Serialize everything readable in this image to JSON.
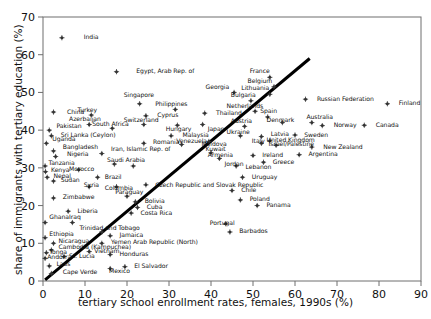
{
  "chart_data": {
    "type": "scatter",
    "title": "",
    "xlabel": "tertiary school enrollment rates, females, 1990s (%)",
    "ylabel": "share of immigrants with tertiary education (%)",
    "xlim": [
      0,
      90
    ],
    "ylim": [
      0,
      70
    ],
    "xticks": [
      0,
      10,
      20,
      30,
      40,
      50,
      60,
      70,
      80,
      90
    ],
    "yticks": [
      0,
      10,
      20,
      30,
      40,
      50,
      60,
      70
    ],
    "grid": false,
    "legend": "none",
    "marker_color": "#333333",
    "trendline_color": "#000000",
    "trendline": {
      "x0": 0.5,
      "y0": 0.3,
      "x1": 63.5,
      "y1": 59.0,
      "label": "fit-line"
    },
    "points": [
      {
        "label": "India",
        "x": 4.5,
        "y": 64.5,
        "lx": 9.0,
        "ly": 64.5
      },
      {
        "label": "Egypt, Arab Rep. of",
        "x": 17.5,
        "y": 55.5,
        "lx": 21.5,
        "ly": 55.5
      },
      {
        "label": "Singapore",
        "x": 23.0,
        "y": 47.0,
        "lx": 18.5,
        "ly": 49.2
      },
      {
        "label": "Georgia",
        "x": 45.5,
        "y": 50.0,
        "lx": 38.0,
        "ly": 51.2
      },
      {
        "label": "Bulgaria",
        "x": 49.5,
        "y": 47.8,
        "lx": 44.0,
        "ly": 49.2
      },
      {
        "label": "Lithuania",
        "x": 54.0,
        "y": 49.5,
        "lx": 46.5,
        "ly": 51.0
      },
      {
        "label": "Belgium",
        "x": 55.0,
        "y": 51.5,
        "lx": 48.0,
        "ly": 53.0
      },
      {
        "label": "France",
        "x": 54.0,
        "y": 54.0,
        "lx": 48.5,
        "ly": 55.5
      },
      {
        "label": "Russian Federation",
        "x": 62.5,
        "y": 48.2,
        "lx": 64.5,
        "ly": 48.2
      },
      {
        "label": "Finland",
        "x": 82.0,
        "y": 47.0,
        "lx": 84.0,
        "ly": 47.0
      },
      {
        "label": "China",
        "x": 2.5,
        "y": 44.8,
        "lx": 5.0,
        "ly": 44.8
      },
      {
        "label": "Turkey",
        "x": 11.5,
        "y": 44.0,
        "lx": 7.5,
        "ly": 45.2
      },
      {
        "label": "Cyprus",
        "x": 24.5,
        "y": 43.8,
        "lx": 26.5,
        "ly": 43.8
      },
      {
        "label": "Philippines",
        "x": 31.5,
        "y": 45.5,
        "lx": 26.0,
        "ly": 46.8
      },
      {
        "label": "Thailand",
        "x": 38.5,
        "y": 44.5,
        "lx": 40.5,
        "ly": 44.5
      },
      {
        "label": "Netherlands",
        "x": 50.5,
        "y": 45.0,
        "lx": 43.0,
        "ly": 46.2
      },
      {
        "label": "Spain",
        "x": 53.5,
        "y": 43.5,
        "lx": 51.0,
        "ly": 45.0
      },
      {
        "label": "Azerbaijan",
        "x": 11.0,
        "y": 41.5,
        "lx": 5.5,
        "ly": 42.8
      },
      {
        "label": "Switzerland",
        "x": 24.0,
        "y": 41.5,
        "lx": 18.5,
        "ly": 42.6
      },
      {
        "label": "South Africa",
        "x": 16.5,
        "y": 40.5,
        "lx": 11.0,
        "ly": 41.5
      },
      {
        "label": "Pakistan",
        "x": 1.5,
        "y": 40.0,
        "lx": 2.5,
        "ly": 41.0
      },
      {
        "label": "Hungary",
        "x": 32.0,
        "y": 41.3,
        "lx": 28.5,
        "ly": 40.2
      },
      {
        "label": "Japan",
        "x": 38.0,
        "y": 41.5,
        "lx": 38.5,
        "ly": 40.2
      },
      {
        "label": "Austria",
        "x": 48.0,
        "y": 41.0,
        "lx": 44.0,
        "ly": 42.2
      },
      {
        "label": "Denmark",
        "x": 57.0,
        "y": 42.0,
        "lx": 52.5,
        "ly": 42.5
      },
      {
        "label": "Australia",
        "x": 64.0,
        "y": 42.0,
        "lx": 62.0,
        "ly": 43.4
      },
      {
        "label": "Norway",
        "x": 66.5,
        "y": 41.2,
        "lx": 68.5,
        "ly": 41.2
      },
      {
        "label": "Canada",
        "x": 76.5,
        "y": 41.3,
        "lx": 78.5,
        "ly": 41.3
      },
      {
        "label": "Sri Lanka (Ceylon)",
        "x": 2.0,
        "y": 38.5,
        "lx": 3.5,
        "ly": 38.5
      },
      {
        "label": "Malaysia",
        "x": 30.5,
        "y": 38.5,
        "lx": 32.5,
        "ly": 38.5
      },
      {
        "label": "Moldova",
        "x": 39.5,
        "y": 37.0,
        "lx": 37.0,
        "ly": 36.2
      },
      {
        "label": "Ukraine",
        "x": 47.0,
        "y": 38.5,
        "lx": 43.0,
        "ly": 39.5
      },
      {
        "label": "Latvia",
        "x": 52.0,
        "y": 38.3,
        "lx": 53.5,
        "ly": 38.8
      },
      {
        "label": "Sweden",
        "x": 60.0,
        "y": 38.7,
        "lx": 61.5,
        "ly": 38.7
      },
      {
        "label": "Uganda",
        "x": 0.8,
        "y": 36.5,
        "lx": 1.5,
        "ly": 37.5
      },
      {
        "label": "Romania",
        "x": 24.0,
        "y": 36.5,
        "lx": 25.5,
        "ly": 36.8
      },
      {
        "label": "Venezuela",
        "x": 33.0,
        "y": 36.2,
        "lx": 31.0,
        "ly": 37.0
      },
      {
        "label": "Italy",
        "x": 52.0,
        "y": 36.5,
        "lx": 49.0,
        "ly": 37.0
      },
      {
        "label": "Israel/Palestine",
        "x": 55.5,
        "y": 36.0,
        "lx": 53.0,
        "ly": 36.2
      },
      {
        "label": "United Kingdom",
        "x": 54.0,
        "y": 37.2,
        "lx": 52.5,
        "ly": 37.2
      },
      {
        "label": "Bangladesh",
        "x": 2.5,
        "y": 34.5,
        "lx": 4.0,
        "ly": 35.3
      },
      {
        "label": "Nigeria",
        "x": 3.0,
        "y": 33.0,
        "lx": 5.0,
        "ly": 33.5
      },
      {
        "label": "Iran, Islamic Rep. of",
        "x": 14.0,
        "y": 33.8,
        "lx": 15.5,
        "ly": 35.0
      },
      {
        "label": "Kuwait",
        "x": 40.0,
        "y": 34.0,
        "lx": 38.0,
        "ly": 34.8
      },
      {
        "label": "Armenia",
        "x": 42.0,
        "y": 32.5,
        "lx": 38.5,
        "ly": 33.2
      },
      {
        "label": "Ireland",
        "x": 50.0,
        "y": 33.3,
        "lx": 51.5,
        "ly": 33.3
      },
      {
        "label": "Tanzania",
        "x": 0.5,
        "y": 30.5,
        "lx": 0.6,
        "ly": 31.2
      },
      {
        "label": "Saudi Arabia",
        "x": 17.0,
        "y": 31.0,
        "lx": 14.5,
        "ly": 32.0
      },
      {
        "label": "Jordan",
        "x": 21.5,
        "y": 30.5,
        "lx": 42.5,
        "ly": 30.8
      },
      {
        "label": "Lebanon",
        "x": 46.0,
        "y": 30.5,
        "lx": 47.5,
        "ly": 30.2
      },
      {
        "label": "Greece",
        "x": 52.5,
        "y": 31.5,
        "lx": 54.0,
        "ly": 31.5
      },
      {
        "label": "Kenya",
        "x": 0.6,
        "y": 29.0,
        "lx": 1.2,
        "ly": 29.3
      },
      {
        "label": "Morocco",
        "x": 8.5,
        "y": 29.5,
        "lx": 5.5,
        "ly": 29.5
      },
      {
        "label": "Nepal",
        "x": 1.0,
        "y": 27.5,
        "lx": 1.8,
        "ly": 27.8
      },
      {
        "label": "Sudan",
        "x": 2.5,
        "y": 26.5,
        "lx": 3.5,
        "ly": 26.6
      },
      {
        "label": "Brazil",
        "x": 13.0,
        "y": 27.5,
        "lx": 14.0,
        "ly": 27.5
      },
      {
        "label": "Uruguay",
        "x": 47.5,
        "y": 27.5,
        "lx": 49.0,
        "ly": 27.5
      },
      {
        "label": "Syria",
        "x": 11.0,
        "y": 25.0,
        "lx": 9.0,
        "ly": 25.2
      },
      {
        "label": "Colombia",
        "x": 17.5,
        "y": 25.0,
        "lx": 14.0,
        "ly": 24.6
      },
      {
        "label": "Czech Republic and Slovak Republic",
        "x": 24.5,
        "y": 25.5,
        "lx": 26.0,
        "ly": 25.3
      },
      {
        "label": "Chile",
        "x": 45.0,
        "y": 24.0,
        "lx": 46.5,
        "ly": 24.0
      },
      {
        "label": "Paraguay",
        "x": 20.0,
        "y": 22.5,
        "lx": 16.5,
        "ly": 23.5
      },
      {
        "label": "Zimbabwe",
        "x": 2.5,
        "y": 22.0,
        "lx": 4.0,
        "ly": 22.2
      },
      {
        "label": "Bolivia",
        "x": 22.0,
        "y": 21.0,
        "lx": 23.5,
        "ly": 21.0
      },
      {
        "label": "Poland",
        "x": 47.0,
        "y": 21.5,
        "lx": 48.5,
        "ly": 21.5
      },
      {
        "label": "Panama",
        "x": 51.0,
        "y": 20.0,
        "lx": 52.5,
        "ly": 20.0
      },
      {
        "label": "Cuba",
        "x": 22.5,
        "y": 19.5,
        "lx": 24.0,
        "ly": 19.5
      },
      {
        "label": "Liberia",
        "x": 6.0,
        "y": 18.5,
        "lx": 7.5,
        "ly": 18.5
      },
      {
        "label": "Costa Rica",
        "x": 21.0,
        "y": 18.0,
        "lx": 22.5,
        "ly": 18.0
      },
      {
        "label": "Ghana",
        "x": 0.5,
        "y": 15.5,
        "lx": 0.8,
        "ly": 16.8
      },
      {
        "label": "Iraq",
        "x": 7.0,
        "y": 15.5,
        "lx": 5.5,
        "ly": 16.8
      },
      {
        "label": "Portugal",
        "x": 43.5,
        "y": 15.2,
        "lx": 39.0,
        "ly": 15.2
      },
      {
        "label": "Trinidad and Tobago",
        "x": 14.0,
        "y": 13.0,
        "lx": 8.0,
        "ly": 14.0
      },
      {
        "label": "Barbados",
        "x": 44.5,
        "y": 13.0,
        "lx": 46.0,
        "ly": 13.0
      },
      {
        "label": "Ethiopia",
        "x": 0.5,
        "y": 11.5,
        "lx": 0.8,
        "ly": 12.3
      },
      {
        "label": "Jamaica",
        "x": 16.0,
        "y": 12.0,
        "lx": 17.5,
        "ly": 12.0
      },
      {
        "label": "Nicaragua",
        "x": 2.5,
        "y": 10.0,
        "lx": 3.0,
        "ly": 10.6
      },
      {
        "label": "Yemen Arab Republic (North)",
        "x": 14.0,
        "y": 10.0,
        "lx": 15.5,
        "ly": 10.2
      },
      {
        "label": "Cambodia (Kampuchea)",
        "x": 2.0,
        "y": 8.2,
        "lx": 3.0,
        "ly": 8.8
      },
      {
        "label": "Tonga",
        "x": 0.8,
        "y": 7.5,
        "lx": 0.8,
        "ly": 7.6
      },
      {
        "label": "Vietnam",
        "x": 11.0,
        "y": 7.8,
        "lx": 11.5,
        "ly": 7.9
      },
      {
        "label": "Honduras",
        "x": 16.0,
        "y": 7.0,
        "lx": 17.5,
        "ly": 7.0
      },
      {
        "label": "Andorra",
        "x": 0.5,
        "y": 6.0,
        "lx": 0.3,
        "ly": 6.3
      },
      {
        "label": "St. Lucia",
        "x": 5.0,
        "y": 6.5,
        "lx": 5.5,
        "ly": 6.5
      },
      {
        "label": "Laos",
        "x": 1.5,
        "y": 4.0,
        "lx": 2.5,
        "ly": 4.3
      },
      {
        "label": "El Salvador",
        "x": 19.5,
        "y": 3.8,
        "lx": 21.0,
        "ly": 3.8
      },
      {
        "label": "Mexico",
        "x": 16.0,
        "y": 3.3,
        "lx": 15.0,
        "ly": 2.4
      },
      {
        "label": "Cape Verde",
        "x": 2.0,
        "y": 2.0,
        "lx": 4.0,
        "ly": 2.2
      },
      {
        "label": "New Zealand",
        "x": 64.0,
        "y": 35.5,
        "lx": 66.0,
        "ly": 35.5
      },
      {
        "label": "Argentina",
        "x": 61.0,
        "y": 33.5,
        "lx": 62.5,
        "ly": 33.5
      }
    ]
  },
  "axis": {
    "x_ticklabels": [
      "0",
      "10",
      "20",
      "30",
      "40",
      "50",
      "60",
      "70",
      "80",
      "90"
    ],
    "y_ticklabels": [
      "0",
      "10",
      "20",
      "30",
      "40",
      "50",
      "60",
      "70"
    ]
  }
}
